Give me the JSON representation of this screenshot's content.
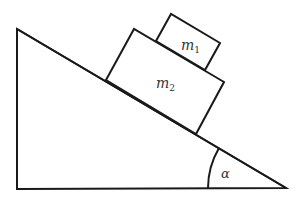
{
  "diagram": {
    "type": "inclined-plane",
    "stroke_color": "#1a1a1a",
    "background": "#ffffff",
    "incline": {
      "vertices": [
        [
          17,
          29
        ],
        [
          17,
          189
        ],
        [
          286,
          188
        ]
      ]
    },
    "blocks": [
      {
        "id": "m2",
        "label": "m",
        "subscript": "2",
        "corners": [
          [
            106,
            80
          ],
          [
            134,
            29
          ],
          [
            224,
            82
          ],
          [
            196,
            134
          ]
        ],
        "label_pos": [
          163,
          88
        ]
      },
      {
        "id": "m1",
        "label": "m",
        "subscript": "1",
        "corners": [
          [
            156,
            41
          ],
          [
            171,
            14
          ],
          [
            220,
            43
          ],
          [
            205,
            70
          ]
        ],
        "label_pos": [
          186,
          49
        ]
      }
    ],
    "angle": {
      "label": "α",
      "label_pos": [
        226,
        177
      ]
    }
  },
  "labels": {
    "m1": "m",
    "m1_sub": "1",
    "m2": "m",
    "m2_sub": "2",
    "alpha": "α"
  }
}
